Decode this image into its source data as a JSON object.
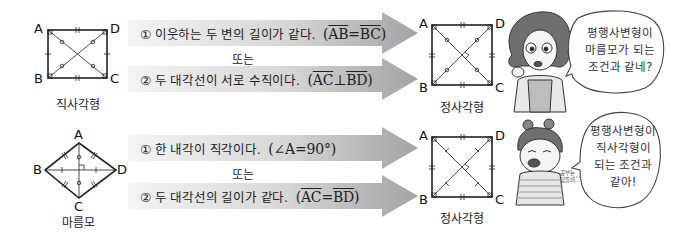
{
  "sections": [
    {
      "from_shape": {
        "name": "직사각형",
        "vertices": [
          "A",
          "B",
          "C",
          "D"
        ]
      },
      "conditions": [
        {
          "number": "①",
          "text": "이웃하는 두 변의 길이가 같다.",
          "math": [
            "AB",
            "=",
            "BC"
          ]
        },
        {
          "number": "②",
          "text": "두 대각선이 서로 수직이다.",
          "math": [
            "AC",
            "⊥",
            "BD"
          ]
        }
      ],
      "connector": "또는",
      "to_shape": {
        "name": "정사각형",
        "vertices": [
          "A",
          "B",
          "C",
          "D"
        ]
      },
      "character": {
        "type": "woman",
        "speech": [
          "평행사변형이",
          "마름모가 되는",
          "조건과 같네?"
        ]
      }
    },
    {
      "from_shape": {
        "name": "마름모",
        "vertices": [
          "A",
          "B",
          "C",
          "D"
        ]
      },
      "conditions": [
        {
          "number": "①",
          "text": "한 내각이 직각이다.",
          "math_plain": "(∠A=90°)"
        },
        {
          "number": "②",
          "text": "두 대각선의 길이가 같다.",
          "math": [
            "AC",
            "=",
            "BD"
          ]
        }
      ],
      "connector": "또는",
      "to_shape": {
        "name": "정사각형",
        "vertices": [
          "A",
          "B",
          "C",
          "D"
        ]
      },
      "character": {
        "type": "girl",
        "aside": [
          "공부는",
          "힘들어…"
        ],
        "speech": [
          "평행사변형이",
          "직사각형이",
          "되는 조건과",
          "같아!"
        ]
      }
    }
  ],
  "colors": {
    "arrow_light": "#f2f2f2",
    "arrow_dark": "#a8a8a8",
    "line": "#222222"
  }
}
